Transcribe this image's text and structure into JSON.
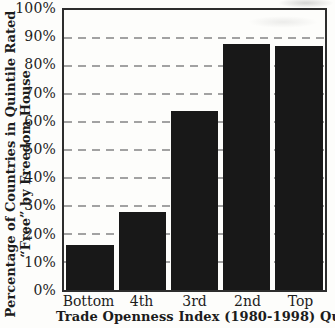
{
  "chart_data": {
    "type": "bar",
    "categories": [
      "Bottom",
      "4th",
      "3rd",
      "2nd",
      "Top"
    ],
    "values": [
      16,
      28,
      64,
      88,
      87
    ],
    "title": "",
    "xlabel": "Trade Openness Index (1980-1998) Quintiles",
    "ylabel_line1": "Percentage of Countries in Quintile Rated",
    "ylabel_line2": "“Free” by Freedom House",
    "yticks": [
      "100%",
      "90%",
      "80%",
      "70%",
      "60%",
      "50%",
      "40%",
      "30%",
      "20%",
      "10%",
      "0%"
    ],
    "ylim": [
      0,
      100
    ],
    "grid": "horizontal dashed",
    "legend": "none",
    "bar_color": "#181818",
    "frame_color": "#2d2d2d",
    "grid_color": "#a2a2a2",
    "background_color": "#fdfdfb",
    "text_color": "#1c1c1c"
  }
}
